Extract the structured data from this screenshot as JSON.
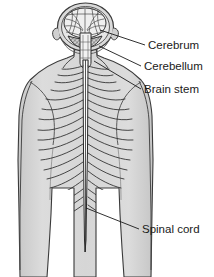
{
  "figure": {
    "view": "posterior",
    "background_color": "#ffffff",
    "body_fill_color": "#d5d5d5",
    "body_outline_color": "#3a3a3a",
    "nerve_line_color": "#2b2b2b",
    "label_text_color": "#1a1a1a",
    "leader_line_color": "#1a1a1a"
  },
  "labels": [
    {
      "id": "cerebrum",
      "text": "Cerebrum",
      "text_x": 149,
      "text_y": 49,
      "leader": {
        "x1": 145,
        "y1": 45,
        "x2": 100,
        "y2": 30
      }
    },
    {
      "id": "cerebellum",
      "text": "Cerebellum",
      "text_x": 145,
      "text_y": 70,
      "leader": {
        "x1": 141,
        "y1": 66,
        "x2": 99,
        "y2": 46
      }
    },
    {
      "id": "brain-stem",
      "text": "Brain stem",
      "text_x": 145,
      "text_y": 93,
      "leader": {
        "x1": 141,
        "y1": 89,
        "x2": 94,
        "y2": 61
      }
    },
    {
      "id": "spinal-cord",
      "text": "Spinal cord",
      "text_x": 143,
      "text_y": 233,
      "leader": {
        "x1": 139,
        "y1": 229,
        "x2": 86,
        "y2": 208
      }
    }
  ],
  "anatomy": {
    "brain": {
      "cerebrum_label": "cerebrum",
      "cerebellum_label": "cerebellum",
      "brain_stem_label": "brain-stem"
    },
    "spinal_cord": {
      "label": "spinal-cord",
      "top_y": 40,
      "bottom_y": 250,
      "center_x": 85.5
    },
    "spinal_nerve_pairs": 18
  }
}
